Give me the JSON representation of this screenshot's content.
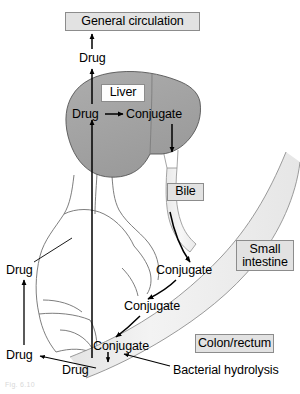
{
  "figure": {
    "caption": "Fig. 6.10",
    "colors": {
      "background": "#ffffff",
      "liver_fill": "#a3a3a3",
      "liver_stroke": "#555555",
      "intestine_fill": "#ededed",
      "intestine_stroke": "#8e8e8e",
      "body_outline": "#6e6e6e",
      "box_fill": "#e2e2e2",
      "box_fill_white": "#fdfdfd",
      "box_border": "#8c8c8c",
      "arrow": "#000000",
      "text": "#000000"
    }
  },
  "boxes": {
    "general_circulation": "General circulation",
    "liver": "Liver",
    "bile": "Bile",
    "small_intestine": "Small intestine",
    "colon_rectum": "Colon/rectum"
  },
  "labels": {
    "drug_top": "Drug",
    "drug_liver": "Drug",
    "conjugate_liver": "Conjugate",
    "drug_left": "Drug",
    "conjugate_intestine_1": "Conjugate",
    "conjugate_intestine_2": "Conjugate",
    "conjugate_colon": "Conjugate",
    "drug_bottom": "Drug",
    "drug_bottom_left": "Drug",
    "bacterial_hydrolysis": "Bacterial hydrolysis"
  },
  "anatomy": {
    "liver_name": "liver-organ",
    "gi_tract_name": "gi-tract-band",
    "body_outline_name": "body-outline"
  },
  "arrows": [
    {
      "name": "arrow-drug-to-general-circulation",
      "from": "Drug",
      "to": "General circulation",
      "direction": "up"
    },
    {
      "name": "arrow-liver-drug-to-drug-top",
      "from": "Drug (liver)",
      "to": "Drug",
      "direction": "up"
    },
    {
      "name": "arrow-portal-drug-into-liver",
      "from": "Drug (gut)",
      "to": "Drug (liver)",
      "direction": "up"
    },
    {
      "name": "arrow-drug-to-conjugate",
      "from": "Drug (liver)",
      "to": "Conjugate (liver)",
      "direction": "right"
    },
    {
      "name": "arrow-conjugate-into-bile",
      "from": "Conjugate (liver)",
      "to": "Bile",
      "direction": "down"
    },
    {
      "name": "arrow-bile-to-intestine-conjugate",
      "from": "Bile",
      "to": "Conjugate (small intestine)",
      "direction": "down"
    },
    {
      "name": "arrow-conjugate-1-to-2",
      "from": "Conjugate",
      "to": "Conjugate",
      "direction": "down-left"
    },
    {
      "name": "arrow-conjugate-2-to-3",
      "from": "Conjugate",
      "to": "Conjugate",
      "direction": "down-left"
    },
    {
      "name": "arrow-conjugate-to-drug-colon",
      "from": "Conjugate (colon)",
      "to": "Drug (colon)",
      "direction": "down"
    },
    {
      "name": "arrow-bacterial-hydrolysis-pointer",
      "from": "Bacterial hydrolysis",
      "to": "Conjugate to Drug step",
      "direction": "up-left"
    },
    {
      "name": "arrow-drug-colon-to-drug-left",
      "from": "Drug (colon)",
      "to": "Drug (left)",
      "direction": "left"
    },
    {
      "name": "arrow-drug-left-absorption",
      "from": "Drug (colon, left)",
      "to": "Drug (left, systemic)",
      "direction": "up"
    }
  ]
}
